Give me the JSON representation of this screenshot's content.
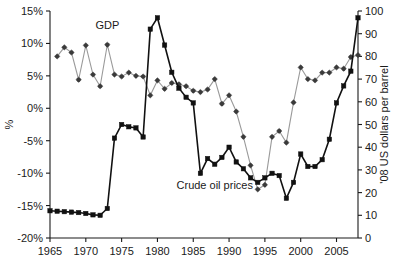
{
  "chart_data": {
    "type": "line",
    "title": "",
    "xlabel": "",
    "ylabel": "%",
    "y2label": "'08 US dollars per barrel",
    "grid": false,
    "legend_position": "inline-annotation",
    "xlim": [
      1965,
      2008
    ],
    "ylim": [
      -20,
      15
    ],
    "y2lim": [
      0,
      100
    ],
    "x_ticks": [
      1965,
      1970,
      1975,
      1980,
      1985,
      1990,
      1995,
      2000,
      2005
    ],
    "x_tick_labels": [
      "1965",
      "1970",
      "1975",
      "1980",
      "1985",
      "1990",
      "1995",
      "2000",
      "2005"
    ],
    "y_ticks": [
      -20,
      -15,
      -10,
      -5,
      0,
      5,
      10,
      15
    ],
    "y_tick_labels": [
      "-20%",
      "-15%",
      "-10%",
      "-5%",
      "0%",
      "5%",
      "10%",
      "15%"
    ],
    "y2_ticks": [
      0,
      10,
      20,
      30,
      40,
      50,
      60,
      70,
      80,
      90,
      100
    ],
    "y2_tick_labels": [
      "0",
      "10",
      "20",
      "30",
      "40",
      "50",
      "60",
      "70",
      "80",
      "90",
      "100"
    ],
    "annotations": [
      {
        "text": "GDP",
        "x": 1973,
        "y": 12.2,
        "series": "gdp"
      },
      {
        "text": "Crude oil prices",
        "x": 1988,
        "y": -12.5,
        "series": "oil"
      }
    ],
    "series": [
      {
        "name": "GDP",
        "axis": "left",
        "units": "%",
        "color": "#9a9a9a",
        "marker": "diamond",
        "x": [
          1966,
          1967,
          1968,
          1969,
          1970,
          1971,
          1972,
          1973,
          1974,
          1975,
          1976,
          1977,
          1978,
          1979,
          1980,
          1981,
          1982,
          1983,
          1984,
          1985,
          1986,
          1987,
          1988,
          1989,
          1990,
          1991,
          1992,
          1993,
          1994,
          1995,
          1996,
          1997,
          1998,
          1999,
          2000,
          2001,
          2002,
          2003,
          2004,
          2005,
          2006,
          2007,
          2008
        ],
        "values": [
          8.0,
          9.4,
          8.6,
          4.4,
          9.7,
          5.2,
          3.4,
          9.8,
          5.2,
          4.9,
          5.5,
          5.0,
          4.9,
          2.0,
          4.3,
          3.0,
          3.9,
          3.7,
          3.4,
          2.7,
          2.5,
          2.9,
          4.5,
          0.7,
          2.0,
          -0.5,
          -4.4,
          -8.8,
          -12.5,
          -11.8,
          -4.4,
          -3.5,
          -5.3,
          0.9,
          6.3,
          4.5,
          4.3,
          5.5,
          5.5,
          6.3,
          6.1,
          7.9,
          8.2
        ]
      },
      {
        "name": "Crude oil prices",
        "axis": "right",
        "units": "'08 US dollars per barrel",
        "color": "#111111",
        "marker": "square",
        "x": [
          1965,
          1966,
          1967,
          1968,
          1969,
          1970,
          1971,
          1972,
          1973,
          1974,
          1975,
          1976,
          1977,
          1978,
          1979,
          1980,
          1981,
          1982,
          1983,
          1984,
          1985,
          1986,
          1987,
          1988,
          1989,
          1990,
          1991,
          1992,
          1993,
          1994,
          1995,
          1996,
          1997,
          1998,
          1999,
          2000,
          2001,
          2002,
          2003,
          2004,
          2005,
          2006,
          2007,
          2008
        ],
        "values": [
          12.0,
          11.8,
          11.6,
          11.4,
          11.2,
          10.8,
          10.2,
          10.0,
          13.0,
          44.0,
          50.0,
          49.0,
          48.5,
          44.5,
          92.0,
          97.0,
          85.0,
          73.0,
          66.0,
          62.0,
          59.5,
          28.5,
          35.0,
          32.5,
          35.5,
          40.0,
          33.5,
          30.5,
          26.5,
          24.5,
          26.5,
          28.5,
          27.5,
          17.5,
          24.5,
          37.0,
          31.5,
          31.5,
          34.5,
          43.5,
          59.5,
          67.0,
          73.5,
          97.0
        ]
      }
    ]
  },
  "labels": {
    "y_axis_title": "%",
    "y2_axis_title": "'08 US dollars per barrel",
    "gdp_annotation": "GDP",
    "oil_annotation": "Crude oil prices"
  }
}
